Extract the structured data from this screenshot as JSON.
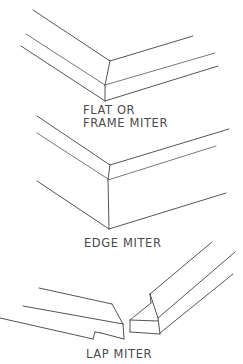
{
  "diagram": {
    "stroke_color": "#555555",
    "figures": [
      {
        "id": "flat-miter",
        "label_lines": [
          "FLAT OR",
          "FRAME MITER"
        ]
      },
      {
        "id": "edge-miter",
        "label_lines": [
          "EDGE MITER"
        ]
      },
      {
        "id": "lap-miter",
        "label_lines": [
          "LAP MITER"
        ]
      }
    ]
  }
}
